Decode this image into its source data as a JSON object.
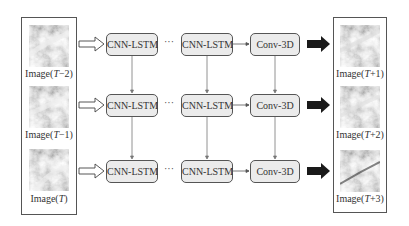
{
  "diagram": {
    "inputs": [
      {
        "label_prefix": "Image(",
        "var": "T",
        "suffix": "−2)"
      },
      {
        "label_prefix": "Image(",
        "var": "T",
        "suffix": "−1)"
      },
      {
        "label_prefix": "Image(",
        "var": "T",
        "suffix": ")"
      }
    ],
    "outputs": [
      {
        "label_prefix": "Image(",
        "var": "T",
        "suffix": "+1)"
      },
      {
        "label_prefix": "Image(",
        "var": "T",
        "suffix": "+2)"
      },
      {
        "label_prefix": "Image(",
        "var": "T",
        "suffix": "+3)"
      }
    ],
    "rows": [
      {
        "cell1": "CNN-LSTM",
        "ellipsis": "···",
        "cell2": "CNN-LSTM",
        "conv": "Conv-3D"
      },
      {
        "cell1": "CNN-LSTM",
        "ellipsis": "···",
        "cell2": "CNN-LSTM",
        "conv": "Conv-3D"
      },
      {
        "cell1": "CNN-LSTM",
        "ellipsis": "···",
        "cell2": "CNN-LSTM",
        "conv": "Conv-3D"
      }
    ],
    "colors": {
      "box_fill": "#ebebeb",
      "box_border": "#555555",
      "output_arrow": "#1a1a1a",
      "input_arrow": "#ffffff"
    }
  }
}
